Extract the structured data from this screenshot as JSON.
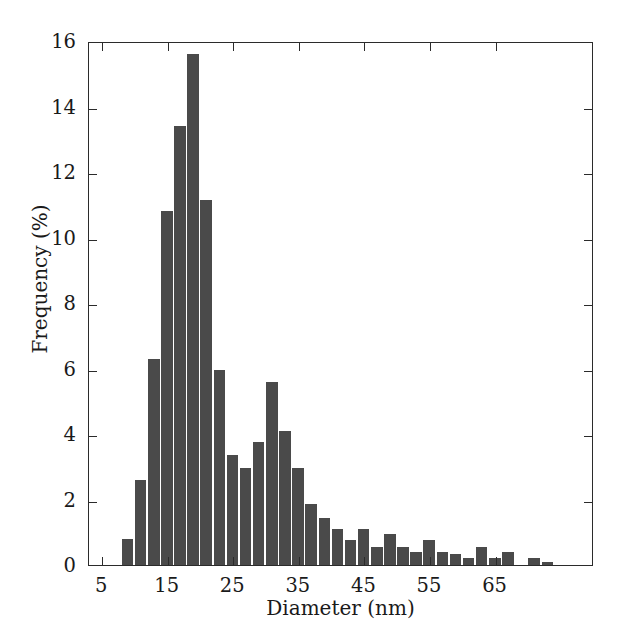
{
  "chart_data": {
    "type": "bar",
    "title": "",
    "subtitle": "",
    "xlabel": "Diameter (nm)",
    "ylabel": "Frequency (%)",
    "xlim": [
      3,
      80
    ],
    "ylim": [
      0,
      16
    ],
    "grid": false,
    "legend": null,
    "bar_color": "#4a4a4a",
    "axis_color": "#2b2b2b",
    "background": "#ffffff",
    "bin_width": 2,
    "xticks": [
      5,
      15,
      25,
      35,
      45,
      55,
      65
    ],
    "xtick_labels": [
      "5",
      "15",
      "25",
      "35",
      "45",
      "55",
      "65"
    ],
    "yticks": [
      0,
      2,
      4,
      6,
      8,
      10,
      12,
      14,
      16
    ],
    "ytick_labels": [
      "0",
      "2",
      "4",
      "6",
      "8",
      "10",
      "12",
      "14",
      "16"
    ],
    "bin_centers": [
      9,
      11,
      13,
      15,
      17,
      19,
      21,
      23,
      25,
      27,
      29,
      31,
      33,
      35,
      37,
      39,
      41,
      43,
      45,
      47,
      49,
      51,
      53,
      55,
      57,
      59,
      61,
      63,
      65,
      67,
      69,
      71,
      73,
      75,
      77
    ],
    "values": [
      0.8,
      2.6,
      6.3,
      10.8,
      13.4,
      15.6,
      11.15,
      5.95,
      3.35,
      2.95,
      3.75,
      5.6,
      4.1,
      2.95,
      1.85,
      1.45,
      1.1,
      0.75,
      1.1,
      0.55,
      0.95,
      0.55,
      0.4,
      0.75,
      0.4,
      0.35,
      0.2,
      0.55,
      0.2,
      0.4,
      0.0,
      0.2,
      0.1,
      0.0,
      0.0
    ],
    "max_value": 15.6,
    "peak_bin_center": 19
  },
  "axes": {
    "x_title": "Diameter (nm)",
    "y_title": "Frequency (%)"
  }
}
